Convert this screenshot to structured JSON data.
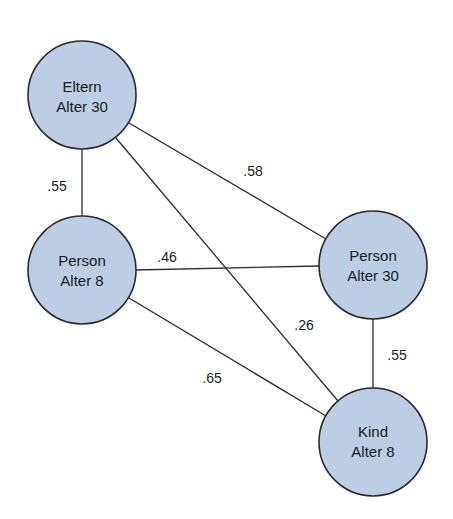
{
  "diagram": {
    "nodes": [
      {
        "id": "eltern30",
        "line1": "Eltern",
        "line2": "Alter 30",
        "cx": 82,
        "cy": 95
      },
      {
        "id": "person8",
        "line1": "Person",
        "line2": "Alter 8",
        "cx": 82,
        "cy": 270
      },
      {
        "id": "person30",
        "line1": "Person",
        "line2": "Alter 30",
        "cx": 373,
        "cy": 265
      },
      {
        "id": "kind8",
        "line1": "Kind",
        "line2": "Alter 8",
        "cx": 373,
        "cy": 442
      }
    ],
    "edges": [
      {
        "from": "eltern30",
        "to": "person8",
        "label": ".55"
      },
      {
        "from": "eltern30",
        "to": "person30",
        "label": ".58"
      },
      {
        "from": "eltern30",
        "to": "kind8",
        "label": ".26"
      },
      {
        "from": "person8",
        "to": "person30",
        "label": ".46"
      },
      {
        "from": "person8",
        "to": "kind8",
        "label": ".65"
      },
      {
        "from": "person30",
        "to": "kind8",
        "label": ".55"
      }
    ],
    "colors": {
      "node_fill": "#bccde4",
      "stroke": "#2a2a2a",
      "text": "#1a1a1a"
    }
  }
}
